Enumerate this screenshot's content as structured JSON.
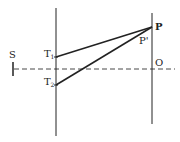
{
  "diagram": {
    "labels": {
      "source": "S",
      "slit1": "T",
      "slit1_sub": "1",
      "slit2": "T",
      "slit2_sub": "2",
      "point_p": "P",
      "point_p_prime": "P'",
      "origin": "O"
    },
    "colors": {
      "stroke": "#222222",
      "background": "#ffffff"
    }
  }
}
